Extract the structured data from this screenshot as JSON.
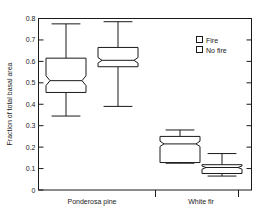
{
  "chart_data": {
    "type": "box",
    "title": "",
    "xlabel": "",
    "ylabel": "Fraction of total basal area",
    "ylim": [
      0,
      0.8
    ],
    "ytick_labels": [
      "0",
      "0.1",
      "0.2",
      "0.3",
      "0.4",
      "0.5",
      "0.6",
      "0.7",
      "0.8"
    ],
    "ytick_values": [
      0,
      0.1,
      0.2,
      0.3,
      0.4,
      0.5,
      0.6,
      0.7,
      0.8
    ],
    "grid": false,
    "notched": true,
    "categories": [
      "Ponderosa pine",
      "White fir"
    ],
    "legend": {
      "position": "top-right",
      "entries": [
        {
          "label": "Fire",
          "marker": "open-square"
        },
        {
          "label": "No fire",
          "marker": "open-square"
        }
      ]
    },
    "boxes": [
      {
        "category": "Ponderosa pine",
        "series": "Fire",
        "whisker_low": 0.345,
        "q1": 0.455,
        "median": 0.51,
        "q3": 0.615,
        "whisker_high": 0.775,
        "notch_low": 0.487,
        "notch_high": 0.533
      },
      {
        "category": "Ponderosa pine",
        "series": "No fire",
        "whisker_low": 0.39,
        "q1": 0.575,
        "median": 0.605,
        "q3": 0.665,
        "whisker_high": 0.785,
        "notch_low": 0.592,
        "notch_high": 0.618
      },
      {
        "category": "White fir",
        "series": "Fire",
        "whisker_low": 0.125,
        "q1": 0.128,
        "median": 0.215,
        "q3": 0.25,
        "whisker_high": 0.28,
        "notch_low": 0.203,
        "notch_high": 0.228
      },
      {
        "category": "White fir",
        "series": "No fire",
        "whisker_low": 0.065,
        "q1": 0.077,
        "median": 0.105,
        "q3": 0.118,
        "whisker_high": 0.17,
        "notch_low": 0.097,
        "notch_high": 0.112
      }
    ]
  },
  "axes": {
    "y_axis_label": "Fraction of total basal area",
    "category_labels": [
      "Ponderosa pine",
      "White fir"
    ]
  },
  "legend": {
    "fire_label": "Fire",
    "no_fire_label": "No fire"
  }
}
